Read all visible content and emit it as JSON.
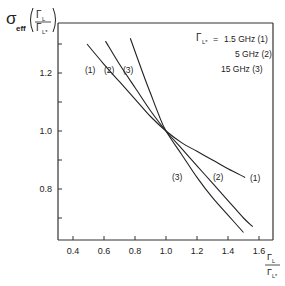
{
  "chart_data": {
    "type": "line",
    "title": "",
    "ylabel": "σ_eff (Γ_L / Γ_L*)",
    "xlabel": "Γ_L / Γ_L*",
    "xlim": [
      0.3,
      1.68
    ],
    "ylim": [
      0.6,
      1.37
    ],
    "x_ticks": [
      "0.4",
      "0.6",
      "0.8",
      "1.0",
      "1.2",
      "1.4",
      "1.6"
    ],
    "y_ticks": [
      "0.8",
      "1.0",
      "1.2"
    ],
    "y_minor_ticks": [
      0.7,
      0.9,
      1.1,
      1.3
    ],
    "grid": false,
    "legend": {
      "symbol": "Γ_L*",
      "equals": "=",
      "entries": [
        {
          "value": "1.5 GHz",
          "id": "(1)"
        },
        {
          "value": "5 GHz",
          "id": "(2)"
        },
        {
          "value": "15 GHz",
          "id": "(3)"
        }
      ],
      "position": "upper right"
    },
    "series": [
      {
        "name": "(1)",
        "label": "1.5 GHz",
        "x": [
          0.49,
          0.6,
          0.7,
          0.8,
          0.9,
          1.0,
          1.1,
          1.2,
          1.3,
          1.4,
          1.51
        ],
        "y": [
          1.3,
          1.23,
          1.17,
          1.11,
          1.05,
          1.0,
          0.96,
          0.93,
          0.9,
          0.87,
          0.84
        ]
      },
      {
        "name": "(2)",
        "label": "5 GHz",
        "x": [
          0.61,
          0.7,
          0.8,
          0.9,
          1.0,
          1.1,
          1.2,
          1.3,
          1.4,
          1.5,
          1.56
        ],
        "y": [
          1.31,
          1.23,
          1.15,
          1.07,
          1.0,
          0.94,
          0.88,
          0.82,
          0.76,
          0.7,
          0.67
        ]
      },
      {
        "name": "(3)",
        "label": "15 GHz",
        "x": [
          0.77,
          0.85,
          0.9,
          0.95,
          1.0,
          1.1,
          1.2,
          1.3,
          1.4,
          1.5
        ],
        "y": [
          1.32,
          1.2,
          1.13,
          1.06,
          1.0,
          0.92,
          0.84,
          0.77,
          0.71,
          0.65
        ]
      }
    ],
    "curve_labels_upper": [
      "(1)",
      "(2)",
      "(3)"
    ],
    "curve_labels_lower": [
      "(3)",
      "(2)",
      "(1)"
    ]
  },
  "text": {
    "sigma": "σ",
    "eff": "eff",
    "gamma_L": "Γ",
    "sub_L": "L",
    "sub_Lstar": "L*",
    "legend_line1_val": "1.5 GHz (1)",
    "legend_line2": "5  GHz  (2)",
    "legend_line3": "15  GHz  (3)",
    "eq": "="
  }
}
